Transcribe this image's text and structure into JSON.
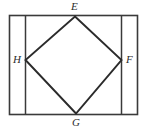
{
  "figure": {
    "type": "geometry-diagram",
    "colors": {
      "stroke": "#3a3a3a",
      "diamond_stroke": "#2b2b2b",
      "background": "#ffffff",
      "label": "#2b2b2b"
    },
    "rectangle": {
      "name": "outer-rectangle",
      "left": 9,
      "top": 15,
      "right": 138,
      "bottom": 115
    },
    "interior_lines": [
      {
        "name": "left-vertical-line",
        "x": 25,
        "y1": 15,
        "y2": 115
      },
      {
        "name": "right-vertical-line",
        "x": 122,
        "y1": 15,
        "y2": 115
      }
    ],
    "diamond": {
      "name": "rhombus-EFGH",
      "vertices": [
        {
          "label": "E",
          "x": 75,
          "y": 16,
          "position": "top"
        },
        {
          "label": "F",
          "x": 122,
          "y": 60,
          "position": "right"
        },
        {
          "label": "G",
          "x": 76,
          "y": 114,
          "position": "bottom"
        },
        {
          "label": "H",
          "x": 25,
          "y": 60,
          "position": "left"
        }
      ]
    },
    "labels": {
      "E": "E",
      "F": "F",
      "G": "G",
      "H": "H"
    }
  }
}
